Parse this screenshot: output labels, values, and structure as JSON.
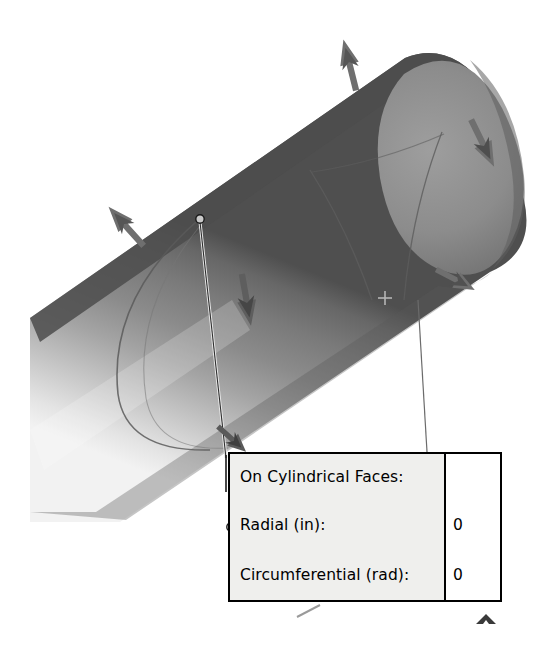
{
  "canvas": {
    "width": 556,
    "height": 655,
    "background": "#ffffff"
  },
  "viewport": {
    "description": "3D FEA model view of a cylindrical pipe with restraint/load arrow symbols and a callout table",
    "model_name": "cylinder-pipe-3d-model"
  },
  "model": {
    "shape": "cylinder",
    "orientation": "diagonal lower-left to upper-right",
    "colors": {
      "highlight": "#e6e6e6",
      "mid": "#9a9a9a",
      "shade": "#6f6f6f",
      "dark_edge": "#4e4e4e",
      "cap_fill": "#8a8a8a",
      "seam_line": "#5a5a5a",
      "arrow": "#6b6b6b",
      "arrow_dark": "#4a4a4a",
      "leader_line": "#6a6a6a",
      "marker_outline": "#000000"
    },
    "seam_label": "split-line-seam",
    "crosshair_label": "origin-crosshair-marker"
  },
  "symbols": {
    "arrows": [
      {
        "name": "restraint-arrow-top-left",
        "label": "arrow",
        "x": 124,
        "y": 224,
        "rotation": -46
      },
      {
        "name": "restraint-arrow-top-center",
        "label": "arrow",
        "x": 349,
        "y": 60,
        "rotation": -18
      },
      {
        "name": "restraint-arrow-top-right",
        "label": "arrow",
        "x": 486,
        "y": 148,
        "rotation": 152
      },
      {
        "name": "restraint-arrow-mid-left",
        "label": "arrow",
        "x": 247,
        "y": 305,
        "rotation": 168
      },
      {
        "name": "restraint-arrow-bottom-right",
        "label": "arrow",
        "x": 460,
        "y": 283,
        "rotation": 118
      },
      {
        "name": "restraint-arrow-bottom-left",
        "label": "arrow",
        "x": 234,
        "y": 443,
        "rotation": 135
      }
    ],
    "leaders": [
      {
        "name": "leader-line-left",
        "from": [
          200,
          220
        ],
        "to": [
          226,
          455
        ]
      },
      {
        "name": "leader-line-right",
        "from": [
          418,
          300
        ],
        "to": [
          427,
          452
        ]
      }
    ],
    "markers": [
      {
        "name": "node-marker-top",
        "x": 200,
        "y": 219,
        "r": 4
      },
      {
        "name": "node-marker-radial",
        "x": 231,
        "y": 527,
        "r": 4
      }
    ],
    "chevron": {
      "name": "chevron-up-icon",
      "x": 486,
      "y": 621
    },
    "tick": {
      "name": "tick-mark",
      "from": [
        298,
        616
      ],
      "to": [
        318,
        606
      ]
    }
  },
  "callout": {
    "title": "On Cylindrical Faces:",
    "rows": [
      {
        "label": "Radial (in):",
        "value": "0"
      },
      {
        "label": "Circumferential (rad):",
        "value": "0"
      }
    ],
    "header_value": "",
    "border_color": "#000000",
    "label_bg": "#efefed",
    "value_bg": "#ffffff"
  }
}
